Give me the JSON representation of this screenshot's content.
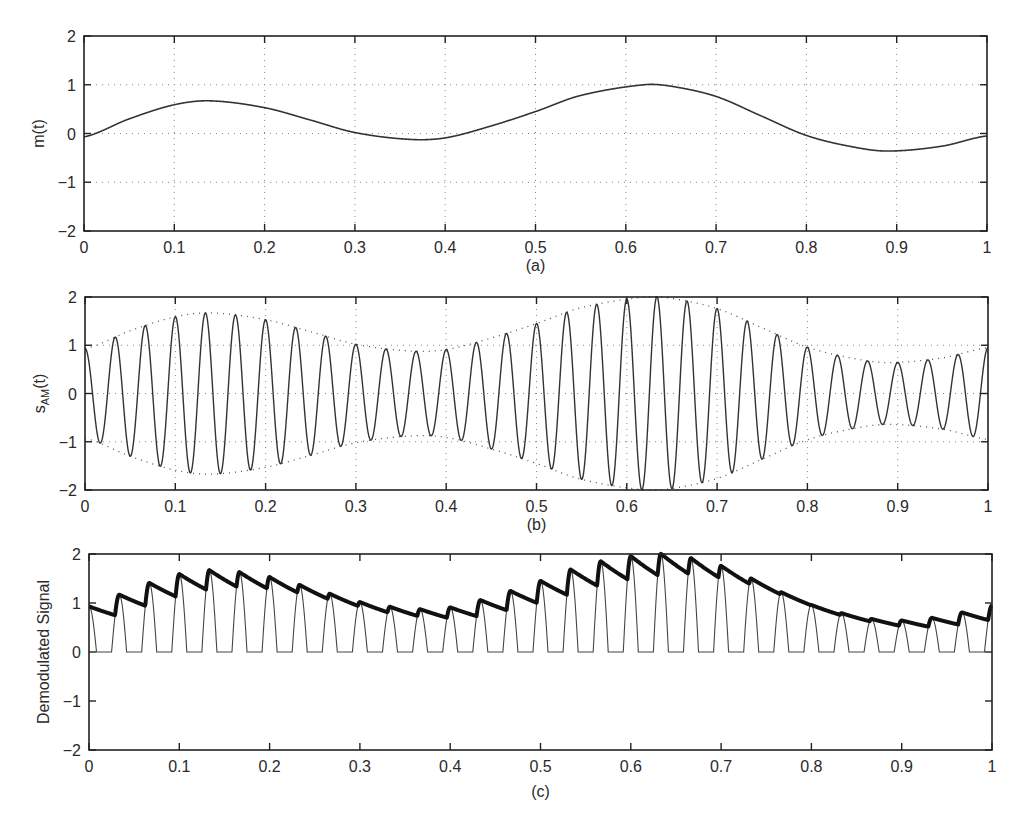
{
  "figure": {
    "panels": [
      {
        "id": "a",
        "caption": "(a)",
        "ylabel": "m(t)"
      },
      {
        "id": "b",
        "caption": "(b)",
        "ylabel_main": "s",
        "ylabel_sub": "AM",
        "ylabel_tail": "(t)"
      },
      {
        "id": "c",
        "caption": "(c)",
        "ylabel": "Demodulated Signal"
      }
    ],
    "xticks": [
      "0",
      "0.1",
      "0.2",
      "0.3",
      "0.4",
      "0.5",
      "0.6",
      "0.7",
      "0.8",
      "0.9",
      "1"
    ],
    "yticks": [
      "2",
      "1",
      "0",
      "−1",
      "−2"
    ]
  },
  "chart_data": [
    {
      "type": "line",
      "title": "",
      "caption": "(a)",
      "xlabel": "",
      "ylabel": "m(t)",
      "xlim": [
        0,
        1
      ],
      "ylim": [
        -2,
        2
      ],
      "grid": true,
      "xticks": [
        0,
        0.1,
        0.2,
        0.3,
        0.4,
        0.5,
        0.6,
        0.7,
        0.8,
        0.9,
        1
      ],
      "yticks": [
        -2,
        -1,
        0,
        1,
        2
      ],
      "series": [
        {
          "name": "m(t)",
          "x": [
            0,
            0.05,
            0.1,
            0.14,
            0.2,
            0.25,
            0.3,
            0.36,
            0.4,
            0.45,
            0.5,
            0.55,
            0.62,
            0.65,
            0.7,
            0.75,
            0.8,
            0.85,
            0.89,
            0.95,
            1.0
          ],
          "y": [
            -0.07,
            0.3,
            0.59,
            0.67,
            0.53,
            0.28,
            0.02,
            -0.12,
            -0.09,
            0.15,
            0.45,
            0.78,
            1.0,
            0.97,
            0.76,
            0.36,
            -0.04,
            -0.27,
            -0.36,
            -0.26,
            -0.05
          ]
        }
      ]
    },
    {
      "type": "line",
      "title": "",
      "caption": "(b)",
      "xlabel": "",
      "ylabel": "s_AM(t)",
      "xlim": [
        0,
        1
      ],
      "ylim": [
        -2,
        2
      ],
      "grid": true,
      "xticks": [
        0,
        0.1,
        0.2,
        0.3,
        0.4,
        0.5,
        0.6,
        0.7,
        0.8,
        0.9,
        1
      ],
      "yticks": [
        -2,
        -1,
        0,
        1,
        2
      ],
      "carrier_frequency_hz": 30,
      "series": [
        {
          "name": "s_AM(t) = [1 + m(t)] cos(2π·30t)",
          "style": "solid"
        },
        {
          "name": "upper envelope 1 + m(t)",
          "style": "dotted"
        },
        {
          "name": "lower envelope −[1 + m(t)]",
          "style": "dotted"
        }
      ]
    },
    {
      "type": "line",
      "title": "",
      "caption": "(c)",
      "xlabel": "",
      "ylabel": "Demodulated Signal",
      "xlim": [
        0,
        1
      ],
      "ylim": [
        -2,
        2
      ],
      "grid": false,
      "xticks": [
        0,
        0.1,
        0.2,
        0.3,
        0.4,
        0.5,
        0.6,
        0.7,
        0.8,
        0.9,
        1
      ],
      "yticks": [
        -2,
        -1,
        0,
        1,
        2
      ],
      "series": [
        {
          "name": "half-wave rectified s_AM(t)",
          "style": "thin"
        },
        {
          "name": "envelope detector output",
          "style": "thick",
          "decay_per_cycle": 0.22
        }
      ]
    }
  ],
  "layout": {
    "panels": [
      {
        "left": 84,
        "top": 36,
        "right": 987,
        "bottom": 231,
        "caption_y": 271
      },
      {
        "left": 85,
        "top": 297,
        "right": 988,
        "bottom": 490,
        "caption_y": 530
      },
      {
        "left": 89,
        "top": 554,
        "right": 992,
        "bottom": 750,
        "caption_y": 797
      }
    ]
  }
}
